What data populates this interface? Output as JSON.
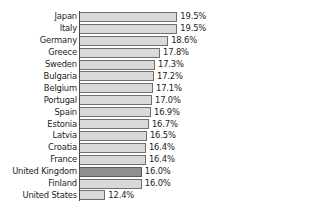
{
  "chart_data": {
    "type": "bar",
    "orientation": "horizontal",
    "title": "",
    "subtitle": "",
    "xlabel": "",
    "ylabel": "",
    "grid": false,
    "legend": null,
    "value_suffix": "%",
    "axis_origin": 9.9,
    "xlim": [
      9.9,
      20.5
    ],
    "highlight_category": "United Kingdom",
    "categories": [
      "Japan",
      "Italy",
      "Germany",
      "Greece",
      "Sweden",
      "Bulgaria",
      "Belgium",
      "Portugal",
      "Spain",
      "Estonia",
      "Latvia",
      "Croatia",
      "France",
      "United Kingdom",
      "Finland",
      "United States"
    ],
    "values": [
      19.5,
      19.5,
      18.6,
      17.8,
      17.3,
      17.2,
      17.1,
      17.0,
      16.9,
      16.7,
      16.5,
      16.4,
      16.4,
      16.0,
      16.0,
      12.4
    ],
    "data_labels": [
      "19.5%",
      "19.5%",
      "18.6%",
      "17.8%",
      "17.3%",
      "17.2%",
      "17.1%",
      "17.0%",
      "16.9%",
      "16.7%",
      "16.5%",
      "16.4%",
      "16.4%",
      "16.0%",
      "16.0%",
      "12.4%"
    ]
  },
  "style": {
    "bar_fill": "#d9d9d9",
    "bar_border": "#6f6f6f",
    "bar_highlight_fill": "#8f8f8f",
    "bar_highlight_border": "#5a5a5a",
    "axis_color": "#4a4a4a",
    "text_color": "#1c1c1c",
    "background": "#ffffff"
  },
  "geometry": {
    "plot_left": 80,
    "plot_top": 11,
    "row_height": 11.9,
    "bar_height": 10.0,
    "px_per_unit": 10.14,
    "label_right": 77,
    "value_gap": 3
  }
}
